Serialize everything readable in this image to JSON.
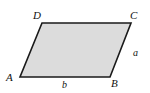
{
  "figure": {
    "name": "parallelogram-diagram",
    "background_color": "#ffffff",
    "shape": {
      "kind": "parallelogram",
      "fill_color": "#dcdcdc",
      "stroke_color": "#1a1a1a",
      "stroke_width": 1.6,
      "vertices": [
        {
          "name": "D",
          "x": 42,
          "y": 23
        },
        {
          "name": "C",
          "x": 131,
          "y": 23
        },
        {
          "name": "B",
          "x": 110,
          "y": 77
        },
        {
          "name": "A",
          "x": 20,
          "y": 77
        }
      ],
      "points_attr": "42,23 131,23 110,77 20,77"
    },
    "vertex_labels": [
      {
        "id": "D",
        "text": "D"
      },
      {
        "id": "C",
        "text": "C"
      },
      {
        "id": "A",
        "text": "A"
      },
      {
        "id": "B",
        "text": "B"
      }
    ],
    "side_labels": [
      {
        "id": "a",
        "text": "a",
        "edge": "BC"
      },
      {
        "id": "b",
        "text": "b",
        "edge": "AB"
      }
    ]
  }
}
